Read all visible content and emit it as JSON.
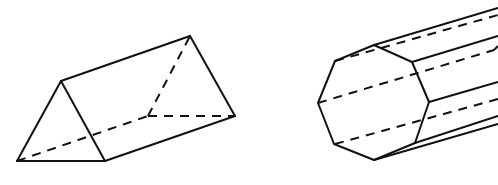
{
  "figure": {
    "colors": {
      "stroke": "#111111",
      "background": "#ffffff"
    },
    "shapes": [
      {
        "name": "triangular-prism",
        "solid_edges": [
          [
            [
              17,
              161
            ],
            [
              61,
              81
            ]
          ],
          [
            [
              61,
              81
            ],
            [
              105,
              161
            ]
          ],
          [
            [
              17,
              161
            ],
            [
              105,
              161
            ]
          ],
          [
            [
              61,
              81
            ],
            [
              190,
              36
            ]
          ],
          [
            [
              190,
              36
            ],
            [
              235,
              116
            ]
          ],
          [
            [
              105,
              161
            ],
            [
              235,
              116
            ]
          ]
        ],
        "dashed_edges": [
          [
            [
              17,
              161
            ],
            [
              148,
              116
            ]
          ],
          [
            [
              148,
              116
            ],
            [
              235,
              116
            ]
          ],
          [
            [
              148,
              116
            ],
            [
              190,
              36
            ]
          ]
        ]
      },
      {
        "name": "octagonal-prism",
        "front_face": [
          [
            374,
            45
          ],
          [
            412,
            62
          ],
          [
            429,
            102
          ],
          [
            415,
            143
          ],
          [
            374,
            160
          ],
          [
            334,
            144
          ],
          [
            318,
            103
          ],
          [
            335,
            61
          ]
        ],
        "solid_edges": [
          [
            [
              374,
              45
            ],
            [
              498,
              8
            ]
          ],
          [
            [
              412,
              62
            ],
            [
              498,
              36
            ]
          ],
          [
            [
              429,
              102
            ],
            [
              498,
              82
            ]
          ],
          [
            [
              415,
              143
            ],
            [
              498,
              116
            ]
          ],
          [
            [
              374,
              160
            ],
            [
              498,
              124
            ]
          ]
        ],
        "dashed_edges": [
          [
            [
              335,
              61
            ],
            [
              498,
              15
            ]
          ],
          [
            [
              318,
              103
            ],
            [
              494,
              50
            ]
          ],
          [
            [
              494,
              50
            ],
            [
              498,
              46
            ]
          ],
          [
            [
              335,
              144
            ],
            [
              498,
              99
            ]
          ]
        ]
      }
    ]
  }
}
